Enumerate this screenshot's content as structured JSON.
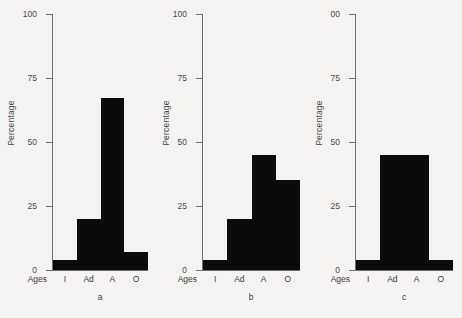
{
  "figure": {
    "background_color": "#f4f3f1",
    "bar_color": "#0b0b0b",
    "axis_color": "#6f6f6f"
  },
  "chart_data": [
    {
      "type": "bar",
      "title": "",
      "caption": "a",
      "xlabel": "Ages",
      "ylabel": "Percentage",
      "categories": [
        "I",
        "Ad",
        "A",
        "O"
      ],
      "values": [
        4,
        20,
        67,
        7
      ],
      "ylim": [
        0,
        100
      ],
      "yticks": [
        0,
        25,
        50,
        75,
        100
      ],
      "ytick_labels": [
        "0",
        "25",
        "50",
        "75",
        "100"
      ],
      "grid": false,
      "legend": false
    },
    {
      "type": "bar",
      "title": "",
      "caption": "b",
      "xlabel": "Ages",
      "ylabel": "Percentage",
      "categories": [
        "I",
        "Ad",
        "A",
        "O"
      ],
      "values": [
        4,
        20,
        45,
        35
      ],
      "ylim": [
        0,
        100
      ],
      "yticks": [
        0,
        25,
        50,
        75,
        100
      ],
      "ytick_labels": [
        "0",
        "25",
        "50",
        "75",
        "100"
      ],
      "grid": false,
      "legend": false
    },
    {
      "type": "bar",
      "title": "",
      "caption": "c",
      "xlabel": "Ages",
      "ylabel": "Percentage",
      "categories": [
        "I",
        "Ad",
        "A",
        "O"
      ],
      "values": [
        4,
        45,
        45,
        4
      ],
      "ylim": [
        0,
        100
      ],
      "yticks": [
        0,
        25,
        50,
        75,
        100
      ],
      "ytick_labels": [
        "0",
        "25",
        "50",
        "75",
        "00"
      ],
      "grid": false,
      "legend": false
    }
  ]
}
